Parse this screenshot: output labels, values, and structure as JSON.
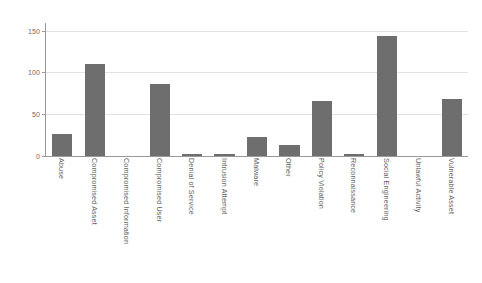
{
  "chart_data": {
    "type": "bar",
    "title": "",
    "subtitle": "",
    "xlabel": "",
    "ylabel": "",
    "ylim": [
      0,
      160
    ],
    "yticks": [
      0,
      50,
      100,
      150
    ],
    "ytick_labels": [
      "0",
      "50",
      "100",
      "150"
    ],
    "grid": true,
    "legend": "none",
    "orientation": "vertical",
    "bar_color": "#6e6e6e",
    "grid_color": "#e2e2e2",
    "axis_color": "#9a9a9a",
    "background_color": "#ffffff",
    "xtick_rotation": 90,
    "categories": [
      "Abuse",
      "Compromised Asset",
      "Compromised Information",
      "Compromised User",
      "Denial of Service",
      "Intrusion Attempt",
      "Malware",
      "Other",
      "Policy Violation",
      "Reconnaissance",
      "Social Engineering",
      "Unlawful Activity",
      "Vulnerable Asset"
    ],
    "values": [
      27,
      111,
      0,
      86,
      3,
      2,
      23,
      13,
      66,
      2,
      144,
      0,
      68
    ]
  }
}
